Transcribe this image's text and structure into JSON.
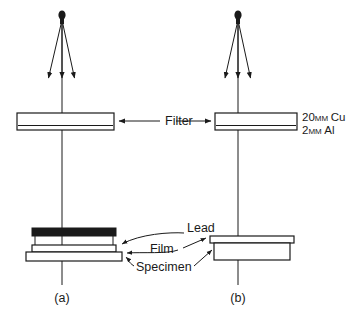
{
  "figure": {
    "background_color": "#ffffff",
    "line_color": "#1a1a1a"
  },
  "labels": {
    "filter": "Filter",
    "lead": "Lead",
    "film": "Film",
    "specimen": "Specimen",
    "filter_cu_value": "20",
    "filter_cu_unit": "MM",
    "filter_cu_material": "Cu",
    "filter_al_value": "2",
    "filter_al_unit": "MM",
    "filter_al_material": "Al",
    "caption_a": "(a)",
    "caption_b": "(b)"
  },
  "panels": [
    {
      "id": "a",
      "caption": "(a)",
      "has_lead_block": true,
      "components": [
        "source",
        "beam-rays",
        "filter",
        "lead",
        "film",
        "specimen"
      ]
    },
    {
      "id": "b",
      "caption": "(b)",
      "has_lead_block": false,
      "components": [
        "source",
        "beam-rays",
        "filter",
        "film",
        "specimen"
      ]
    }
  ],
  "icons": {
    "source": "source-point-icon",
    "ray": "ray-arrow-icon",
    "leader": "leader-line-icon"
  }
}
